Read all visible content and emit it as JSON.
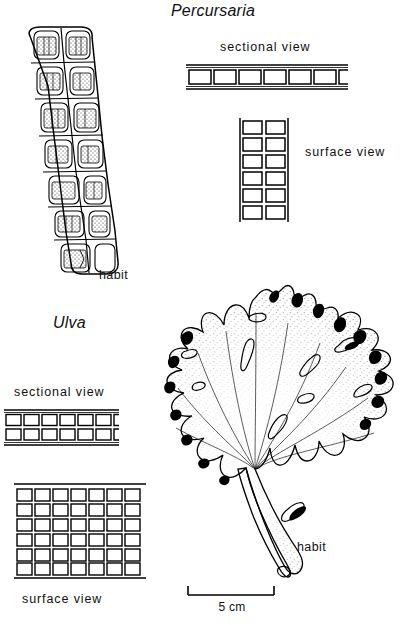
{
  "figure": {
    "title_percursaria": "Percursaria",
    "title_ulva": "Ulva",
    "background_color": "#ffffff",
    "ink_color": "#000000"
  },
  "percursaria": {
    "genus": "Percursaria",
    "habit_label": "habit",
    "sectional_label": "sectional view",
    "surface_label": "surface view",
    "sectional_view": {
      "rows": 1,
      "cells_per_row": 6,
      "partial_cell_at_right": true
    },
    "surface_view": {
      "columns": 2,
      "rows": 6
    },
    "habit": {
      "description": "uniseriate-to-biseriate filament of paired cells with stippled chloroplasts, tapering downward",
      "cell_pairs": 7
    }
  },
  "ulva": {
    "genus": "Ulva",
    "habit_label": "habit",
    "sectional_label": "sectional view",
    "surface_label": "surface view",
    "sectional_view": {
      "rows": 2,
      "cells_per_row": 6,
      "partial_cell_at_right": true
    },
    "surface_view": {
      "columns": 7,
      "rows": 6
    },
    "habit": {
      "description": "broad ruffled sea-lettuce blade with lobed dark margins, stippled surface, scattered perforations and a narrow tapering stipe"
    }
  },
  "scale_bar": {
    "label": "5 cm",
    "length_px": 88
  }
}
